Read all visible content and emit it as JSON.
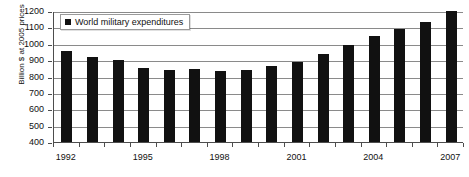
{
  "chart_data": {
    "type": "bar",
    "title": "",
    "subtitle": "",
    "xlabel": "",
    "ylabel": "Billion $ at 2005 prices",
    "ylim": [
      400,
      1200
    ],
    "ytick_step": 100,
    "yticks": [
      400,
      500,
      600,
      700,
      800,
      900,
      1000,
      1100,
      1200
    ],
    "grid": true,
    "grid_axis": "y",
    "legend": {
      "position": "top-left-inside",
      "entries": [
        {
          "label": "World military expenditures",
          "color": "#111111",
          "marker": "square"
        }
      ]
    },
    "categories": [
      1992,
      1993,
      1994,
      1995,
      1996,
      1997,
      1998,
      1999,
      2000,
      2001,
      2002,
      2003,
      2004,
      2005,
      2006,
      2007
    ],
    "xtick_labels": [
      "1992",
      "1995",
      "1998",
      "2001",
      "2004",
      "2007"
    ],
    "xtick_label_indices": [
      0,
      3,
      6,
      9,
      12,
      15
    ],
    "series": [
      {
        "name": "World military expenditures",
        "color": "#111111",
        "values": [
          957,
          922,
          898,
          852,
          838,
          845,
          832,
          838,
          867,
          890,
          935,
          995,
          1048,
          1093,
          1130,
          1198
        ]
      }
    ]
  },
  "axis": {
    "y_title": "Billion $ at 2005 prices"
  },
  "legend": {
    "series_label": "World military expenditures"
  },
  "colors": {
    "bar": "#111111",
    "gridline": "#8a8a8a",
    "axis": "#4d4d4d",
    "background": "#ffffff",
    "text": "#111111"
  }
}
